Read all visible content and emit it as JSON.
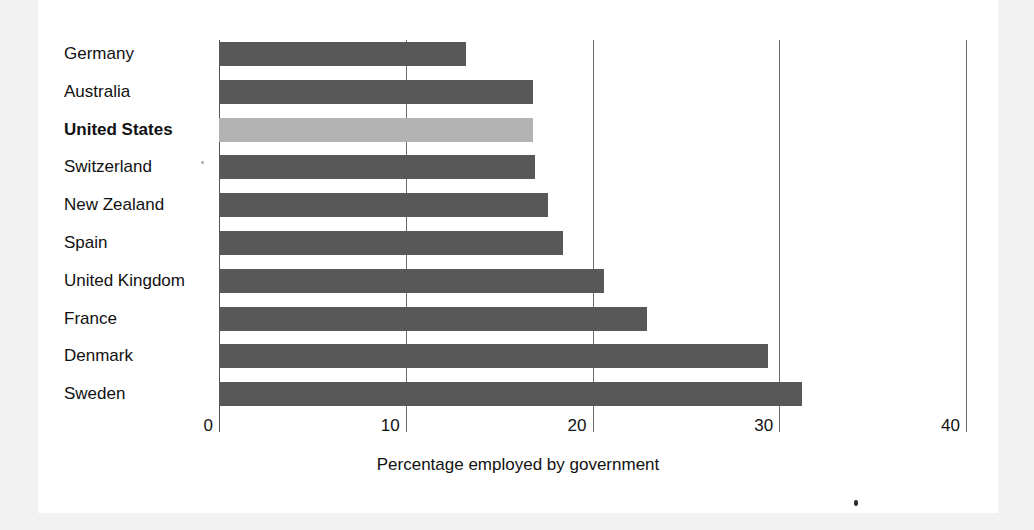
{
  "chart_data": {
    "type": "bar",
    "orientation": "horizontal",
    "title": "",
    "xlabel": "Percentage employed by government",
    "ylabel": "",
    "xlim": [
      0,
      40
    ],
    "xticks": [
      0,
      10,
      20,
      30,
      40
    ],
    "xtick_labels": [
      "0",
      "10",
      "20",
      "30",
      "40"
    ],
    "grid": true,
    "grid_axis": "x",
    "legend": false,
    "categories": [
      "Germany",
      "Australia",
      "United States",
      "Switzerland",
      "New Zealand",
      "Spain",
      "United Kingdom",
      "France",
      "Denmark",
      "Sweden"
    ],
    "values": [
      13.2,
      16.8,
      16.8,
      16.9,
      17.6,
      18.4,
      20.6,
      22.9,
      29.4,
      31.2
    ],
    "highlight_category": "United States",
    "colors": {
      "bar": "#585858",
      "bar_highlight": "#b3b3b3",
      "gridline": "#6e6e6e",
      "text": "#111111",
      "card_background": "#ffffff",
      "page_background": "#f2f2f2"
    },
    "bars": [
      {
        "label": "Germany",
        "value": 13.2,
        "highlight": false
      },
      {
        "label": "Australia",
        "value": 16.8,
        "highlight": false
      },
      {
        "label": "United States",
        "value": 16.8,
        "highlight": true
      },
      {
        "label": "Switzerland",
        "value": 16.9,
        "highlight": false
      },
      {
        "label": "New Zealand",
        "value": 17.6,
        "highlight": false
      },
      {
        "label": "Spain",
        "value": 18.4,
        "highlight": false
      },
      {
        "label": "United Kingdom",
        "value": 20.6,
        "highlight": false
      },
      {
        "label": "France",
        "value": 22.9,
        "highlight": false
      },
      {
        "label": "Denmark",
        "value": 29.4,
        "highlight": false
      },
      {
        "label": "Sweden",
        "value": 31.2,
        "highlight": false
      }
    ]
  },
  "axis": {
    "x_title": "Percentage employed by government",
    "ticks": [
      "0",
      "10",
      "20",
      "30",
      "40"
    ]
  },
  "labels": {
    "germany": "Germany",
    "australia": "Australia",
    "united_states": "United States",
    "switzerland": "Switzerland",
    "new_zealand": "New Zealand",
    "spain": "Spain",
    "united_kingdom": "United Kingdom",
    "france": "France",
    "denmark": "Denmark",
    "sweden": "Sweden"
  }
}
